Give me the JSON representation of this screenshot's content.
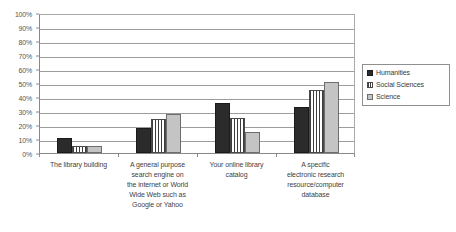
{
  "chart_data": {
    "type": "bar",
    "title": "",
    "subtitle": "",
    "xlabel": "",
    "ylabel": "",
    "ylim": [
      0,
      100
    ],
    "grid": true,
    "legend_position": "right",
    "categories": [
      "The library building",
      "A general purpose search engine on the internet or World Wide Web such as Google or Yahoo",
      "Your online library catalog",
      "A specific electronic research resource/computer database"
    ],
    "category_lines": [
      [
        "The library building"
      ],
      [
        "A general purpose",
        "search engine on",
        "the internet or World",
        "Wide Web such as",
        "Google or Yahoo"
      ],
      [
        "Your online library",
        "catalog"
      ],
      [
        "A specific",
        "electronic research",
        "resource/computer",
        "database"
      ]
    ],
    "series": [
      {
        "name": "Humanities",
        "color": "#2b2b2b",
        "pattern": "solid-dark",
        "values": [
          11,
          18,
          36,
          33
        ]
      },
      {
        "name": "Social Sciences",
        "color": "#3d3d3d",
        "pattern": "vertical-stripes",
        "values": [
          5,
          24,
          25,
          45
        ]
      },
      {
        "name": "Science",
        "color": "#c4c4c4",
        "pattern": "solid-light",
        "values": [
          5,
          28,
          15,
          51
        ]
      }
    ],
    "y_ticks": [
      "0%",
      "10%",
      "20%",
      "30%",
      "40%",
      "50%",
      "60%",
      "70%",
      "80%",
      "90%",
      "100%"
    ],
    "y_tick_values": [
      0,
      10,
      20,
      30,
      40,
      50,
      60,
      70,
      80,
      90,
      100
    ]
  },
  "legend": {
    "items": [
      {
        "label": "Humanities"
      },
      {
        "label": "Social Sciences"
      },
      {
        "label": "Science"
      }
    ]
  },
  "colors": {
    "humanities": "#2b2b2b",
    "social_sciences": "#3d3d3d",
    "science": "#c4c4c4",
    "gridline": "#9c9c9c",
    "axis": "#888888",
    "text": "#3a3a3a",
    "background": "#ffffff"
  }
}
